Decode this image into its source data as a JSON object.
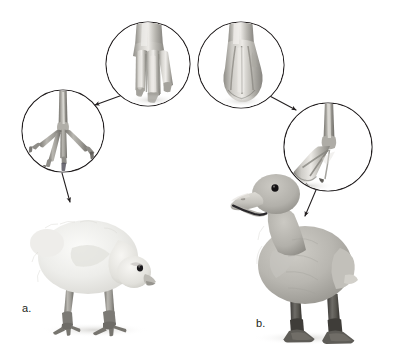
{
  "figure": {
    "background_color": "#ffffff",
    "width": 395,
    "height": 357
  },
  "labels": {
    "a": "a.",
    "b": "b."
  },
  "panels": [
    {
      "id": "a",
      "label": "a.",
      "subject": "chick",
      "description": "Downy chick with head lowered, anisodactyl (non-webbed) foot",
      "body_color": "#e8e7e3",
      "leg_color": "#8d8b86"
    },
    {
      "id": "b",
      "label": "b.",
      "subject": "duckling",
      "description": "Duckling standing upright with open bill, palmate (webbed) foot",
      "body_color": "#b6b4ae",
      "leg_color": "#53514d"
    }
  ],
  "callouts": [
    {
      "id": "chick-foot-circle",
      "name": "chick-whole-foot",
      "content": "chick foot with three forward separate toes and claws",
      "cx": 63,
      "cy": 131,
      "r": 41,
      "stroke": "#231f20"
    },
    {
      "id": "chick-toe-circle",
      "name": "chick-toe-closeup",
      "content": "close-up of chick toes showing unwebbed, separated digits",
      "cx": 148,
      "cy": 64,
      "r": 42,
      "stroke": "#231f20"
    },
    {
      "id": "duck-toe-circle",
      "name": "duckling-toe-closeup",
      "content": "close-up of duckling toes showing skin webbing between digits",
      "cx": 241,
      "cy": 65,
      "r": 43,
      "stroke": "#231f20"
    },
    {
      "id": "duck-foot-circle",
      "name": "duckling-whole-foot",
      "content": "duckling foot with palmate webbing joining the toes",
      "cx": 328,
      "cy": 147,
      "r": 44,
      "stroke": "#231f20"
    }
  ],
  "connectors": [
    {
      "id": "chick-toe-to-foot",
      "from": "chick-toe-closeup",
      "to": "chick-whole-foot",
      "direction": "down-left",
      "has_arrowhead": true
    },
    {
      "id": "chick-foot-to-chick",
      "from": "chick-whole-foot",
      "to": "chick",
      "direction": "down",
      "has_arrowhead": true
    },
    {
      "id": "duck-toe-to-foot",
      "from": "duckling-toe-closeup",
      "to": "duckling-whole-foot",
      "direction": "down-right",
      "has_arrowhead": true
    },
    {
      "id": "duck-foot-to-duckling",
      "from": "duckling-whole-foot",
      "to": "duckling",
      "direction": "down",
      "has_arrowhead": true
    }
  ],
  "colors": {
    "line": "#231f20",
    "text": "#231f20",
    "background": "#ffffff",
    "chick_down": "#e9e8e4",
    "duckling_down": "#b5b3ad",
    "foot_gray": "#9b9992",
    "dark_leg": "#4f4d49"
  }
}
